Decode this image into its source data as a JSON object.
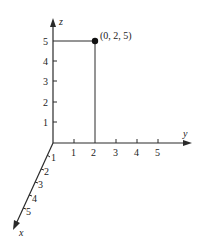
{
  "diagram": {
    "type": "3d-coordinate-axes",
    "axes": {
      "x": {
        "label": "x",
        "ticks": [
          "1",
          "2",
          "3",
          "4",
          "5"
        ]
      },
      "y": {
        "label": "y",
        "ticks": [
          "1",
          "2",
          "3",
          "4",
          "5"
        ]
      },
      "z": {
        "label": "z",
        "ticks": [
          "1",
          "2",
          "3",
          "4",
          "5"
        ]
      }
    },
    "point": {
      "label": "(0, 2, 5)",
      "coords": [
        0,
        2,
        5
      ]
    },
    "colors": {
      "axis": "#2a2a2a",
      "guide": "#2a2a2a",
      "point": "#111111"
    }
  }
}
